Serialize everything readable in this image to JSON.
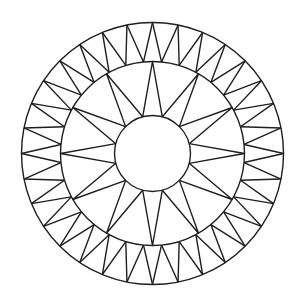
{
  "figure": {
    "colors": {
      "background": "#ffffff",
      "line": "#1e1e1e"
    },
    "star": {
      "points": 12,
      "first_tip_angle_deg": 90
    },
    "outer_ring": {
      "zigzag_outer_vertices": 32,
      "first_outer_vertex_angle_deg": 90
    }
  }
}
